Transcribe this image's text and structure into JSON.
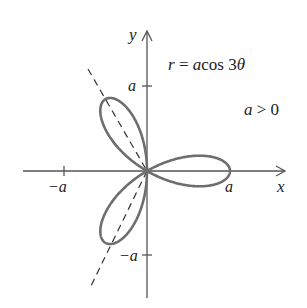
{
  "chart_data": {
    "type": "line",
    "title": "",
    "equation": "r = a cos 3θ",
    "condition": "a > 0",
    "xlabel": "x",
    "ylabel": "y",
    "x_ticks": [
      "−a",
      "a"
    ],
    "y_ticks": [
      "a",
      "−a"
    ],
    "curve": "three-leaved rose r = a cos 3θ, petals centered at θ = 0°, 120°, 240°",
    "petal_axes_deg": [
      0,
      120,
      240
    ],
    "dashed_line": "line through origin along θ = 120° / 300° direction",
    "grid": false,
    "legend": "none"
  },
  "labels": {
    "equation_r": "r",
    "equation_eq": " = ",
    "equation_a": "a",
    "equation_cos": "cos 3",
    "equation_theta": "θ",
    "condition_a": "a",
    "condition_rest": " > 0",
    "x_axis": "x",
    "y_axis": "y",
    "x_tick_pos": "a",
    "x_tick_neg": "−a",
    "y_tick_pos": "a",
    "y_tick_neg": "−a"
  },
  "colors": {
    "curve": "#6e6e6e",
    "axes": "#555555",
    "text": "#222222"
  }
}
